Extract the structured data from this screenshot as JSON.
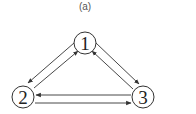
{
  "caption": "(a)",
  "graph": {
    "nodes": [
      {
        "id": "1",
        "label": "1",
        "x": 85,
        "y": 43
      },
      {
        "id": "2",
        "label": "2",
        "x": 23,
        "y": 97
      },
      {
        "id": "3",
        "label": "3",
        "x": 143,
        "y": 97
      }
    ],
    "edges": [
      {
        "from": "1",
        "to": "2"
      },
      {
        "from": "2",
        "to": "1"
      },
      {
        "from": "1",
        "to": "3"
      },
      {
        "from": "3",
        "to": "1"
      },
      {
        "from": "3",
        "to": "2"
      },
      {
        "from": "2",
        "to": "3"
      }
    ],
    "colors": {
      "stroke": "#333333",
      "fill": "#ffffff"
    }
  }
}
